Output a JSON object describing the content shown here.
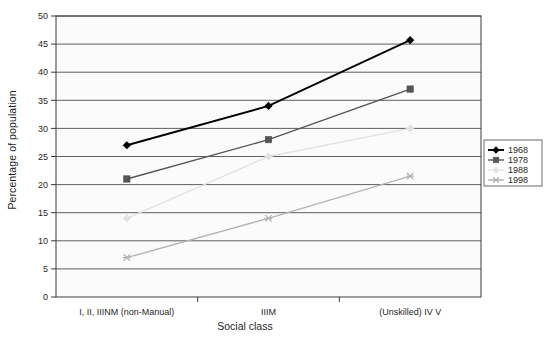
{
  "chart_data": {
    "type": "line",
    "title": "",
    "xlabel": "Social class",
    "ylabel": "Percentage of population",
    "categories": [
      "I, II, IIINM (non-Manual)",
      "IIIM",
      "(Unskilled) IV V"
    ],
    "ylim": [
      0,
      50
    ],
    "yticks": [
      "0",
      "5",
      "10",
      "15",
      "20",
      "25",
      "30",
      "35",
      "40",
      "45",
      "50"
    ],
    "grid": true,
    "legend_position": "right",
    "series": [
      {
        "name": "1968",
        "values": [
          27,
          34,
          45.7
        ],
        "color": "#000000",
        "marker": "diamond"
      },
      {
        "name": "1978",
        "values": [
          21,
          28,
          37
        ],
        "color": "#555555",
        "marker": "square"
      },
      {
        "name": "1988",
        "values": [
          14,
          25,
          30
        ],
        "color": "#e2e2e2",
        "marker": "diamond"
      },
      {
        "name": "1998",
        "values": [
          7,
          14,
          21.5
        ],
        "color": "#b4b4b4",
        "marker": "cross"
      }
    ]
  },
  "axis": {
    "y_title": "Percentage of population",
    "x_title": "Social class",
    "y_ticks": [
      "50",
      "45",
      "40",
      "35",
      "30",
      "25",
      "20",
      "15",
      "10",
      "5",
      "0"
    ],
    "x_categories": [
      "I, II, IIINM (non-Manual)",
      "IIIM",
      "(Unskilled) IV V"
    ]
  },
  "legend": {
    "items": [
      {
        "label": "1968"
      },
      {
        "label": "1978"
      },
      {
        "label": "1988"
      },
      {
        "label": "1998"
      }
    ]
  },
  "colors": {
    "plot_border": "#3a3a3a",
    "gridline": "#4d4d4d",
    "plot_background": "#fbfbfb",
    "legend_border": "#6b6b6b"
  }
}
